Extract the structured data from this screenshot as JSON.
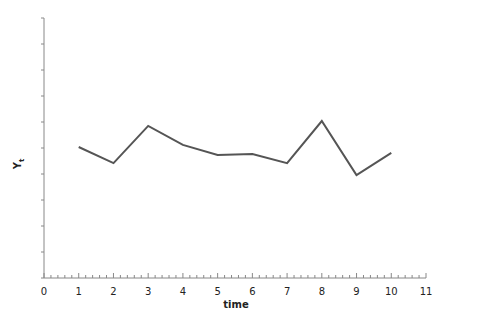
{
  "chart_data": {
    "type": "line",
    "title": "",
    "xlabel": "time",
    "ylabel": "Y_t",
    "ylabel_main": "Y",
    "ylabel_sub": "t",
    "x": [
      1,
      2,
      3,
      4,
      5,
      6,
      7,
      8,
      9,
      10
    ],
    "series": [
      {
        "name": "Y_t",
        "values": [
          5.04,
          4.42,
          5.85,
          5.12,
          4.73,
          4.77,
          4.42,
          6.04,
          3.96,
          4.81
        ]
      }
    ],
    "xlim": [
      0,
      11
    ],
    "ylim": [
      0,
      10
    ],
    "x_ticks": [
      "0",
      "1",
      "2",
      "3",
      "4",
      "5",
      "6",
      "7",
      "8",
      "9",
      "10",
      "11"
    ],
    "x_minor_ticks_per_unit": 5,
    "y_tick_count": 11,
    "y_tick_labels_shown": false,
    "grid": false,
    "legend": null,
    "line_color": "#555555",
    "axis_color": "#888888"
  }
}
